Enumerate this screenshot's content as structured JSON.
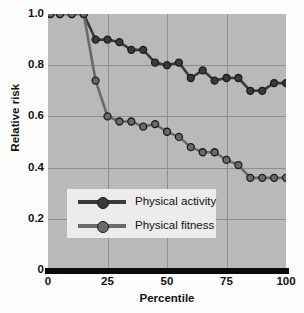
{
  "chart_data": {
    "type": "line",
    "title": "",
    "subtitle": "",
    "xlabel": "Percentile",
    "ylabel": "Relative risk",
    "xlim": [
      0,
      100
    ],
    "ylim": [
      0,
      1.0
    ],
    "xticks": [
      "0",
      "25",
      "50",
      "75",
      "100"
    ],
    "xtick_values": [
      0,
      25,
      50,
      75,
      100
    ],
    "yticks": [
      "0",
      "0.2",
      "0.4",
      "0.6",
      "0.8",
      "1.0"
    ],
    "ytick_values": [
      0,
      0.2,
      0.4,
      0.6,
      0.8,
      1.0
    ],
    "grid": "major-xy",
    "legend_position": "center-left-lower",
    "plot_background": "#b9b9b9",
    "series": [
      {
        "name": "Physical activity",
        "color": "#3a3a3a",
        "marker": "circle",
        "x": [
          1,
          5,
          10,
          15,
          20,
          25,
          30,
          35,
          40,
          45,
          50,
          55,
          60,
          65,
          70,
          75,
          80,
          85,
          90,
          95,
          100
        ],
        "values": [
          1.0,
          1.0,
          1.0,
          1.0,
          0.9,
          0.9,
          0.89,
          0.86,
          0.86,
          0.81,
          0.8,
          0.81,
          0.75,
          0.78,
          0.74,
          0.75,
          0.75,
          0.7,
          0.7,
          0.73,
          0.73
        ]
      },
      {
        "name": "Physical fitness",
        "color": "#6a6a6a",
        "marker": "circle",
        "x": [
          1,
          5,
          10,
          15,
          20,
          25,
          30,
          35,
          40,
          45,
          50,
          55,
          60,
          65,
          70,
          75,
          80,
          85,
          90,
          95,
          100
        ],
        "values": [
          1.0,
          1.0,
          1.0,
          1.0,
          0.74,
          0.6,
          0.58,
          0.58,
          0.56,
          0.57,
          0.54,
          0.52,
          0.48,
          0.46,
          0.46,
          0.43,
          0.41,
          0.36,
          0.36,
          0.36,
          0.36
        ]
      }
    ]
  },
  "legend": {
    "items": [
      {
        "label": "Physical activity"
      },
      {
        "label": "Physical fitness"
      }
    ]
  },
  "axes": {
    "ylabel": "Relative risk",
    "xlabel": "Percentile",
    "ytick_labels": [
      "1.0",
      "0.8",
      "0.6",
      "0.4",
      "0.2",
      "0"
    ],
    "xtick_labels": [
      "0",
      "25",
      "50",
      "75",
      "100"
    ]
  }
}
